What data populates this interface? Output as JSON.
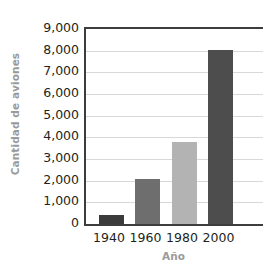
{
  "chart_data": {
    "type": "bar",
    "title": "",
    "subtitle": "",
    "xlabel": "Año",
    "ylabel": "Cantidad de aviones",
    "categories": [
      "1940",
      "1960",
      "1980",
      "2000"
    ],
    "values": [
      400,
      2100,
      3800,
      8050
    ],
    "series": [
      {
        "name": "Cantidad de aviones",
        "values": [
          400,
          2100,
          3800,
          8050
        ]
      }
    ],
    "ylim": [
      0,
      9000
    ],
    "ytick_values": [
      0,
      1000,
      2000,
      3000,
      4000,
      5000,
      6000,
      7000,
      8000,
      9000
    ],
    "ytick_labels": [
      "0",
      "1,000",
      "2,000",
      "3,000",
      "4,000",
      "5,000",
      "6,000",
      "7,000",
      "8,000",
      "9,000"
    ],
    "grid": "horizontal",
    "legend": "none",
    "annotations": [],
    "bar_colors": [
      "#3b3b3b",
      "#6e6e6e",
      "#b3b3b3",
      "#4d4d4d"
    ]
  },
  "style": {
    "background": "#ffffff",
    "axis_color": "#3d3d3d",
    "gridline_color": "#d8d8d8",
    "tick_text_color": "#231f20",
    "axis_title_color": "#9a9a9a"
  }
}
